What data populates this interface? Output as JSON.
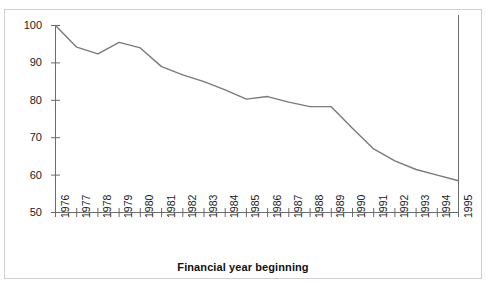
{
  "figure": {
    "axis_title": "Financial year beginning",
    "background_color": "#ffffff",
    "frame_color": "#cfcfcf",
    "line_color": "#7a7a7a",
    "axis_color": "#6b6b6b",
    "text_color": "#1a1a1a"
  },
  "chart_data": {
    "type": "line",
    "title": "",
    "subtitle": "",
    "xlabel": "Financial year beginning",
    "ylabel": "",
    "categories": [
      "1976",
      "1977",
      "1978",
      "1979",
      "1980",
      "1981",
      "1982",
      "1983",
      "1984",
      "1985",
      "1986",
      "1987",
      "1988",
      "1989",
      "1990",
      "1991",
      "1992",
      "1993",
      "1994",
      "1995"
    ],
    "values": [
      100,
      94.2,
      92.4,
      95.5,
      94.0,
      89.0,
      86.8,
      85.0,
      82.8,
      80.3,
      81.0,
      79.5,
      78.3,
      78.3,
      72.5,
      67.0,
      63.8,
      61.5,
      60.0,
      58.5
    ],
    "series": [
      {
        "name": "index",
        "values": [
          100,
          94.2,
          92.4,
          95.5,
          94.0,
          89.0,
          86.8,
          85.0,
          82.8,
          80.3,
          81.0,
          79.5,
          78.3,
          78.3,
          72.5,
          67.0,
          63.8,
          61.5,
          60.0,
          58.5
        ]
      }
    ],
    "ylim": [
      50,
      100
    ],
    "ytick_values": [
      50,
      60,
      70,
      80,
      90,
      100
    ],
    "ytick_labels": [
      "50",
      "60",
      "70",
      "80",
      "90",
      "100"
    ],
    "xtick_labels": [
      "1976",
      "1977",
      "1978",
      "1979",
      "1980",
      "1981",
      "1982",
      "1983",
      "1984",
      "1985",
      "1986",
      "1987",
      "1988",
      "1989",
      "1990",
      "1991",
      "1992",
      "1993",
      "1994",
      "1995"
    ],
    "grid": false,
    "legend": null,
    "legend_position": "none",
    "annotations": [
      {
        "name": "right-boundary-rule",
        "description": "vertical rule at 1995 extending above plot top"
      }
    ]
  }
}
